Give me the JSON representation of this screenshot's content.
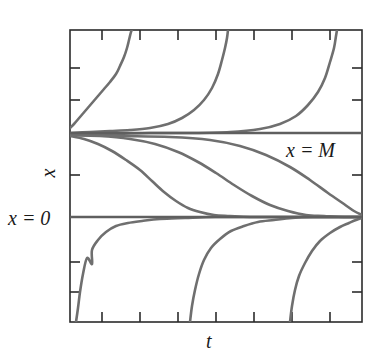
{
  "figure": {
    "kind": "solution-curves-plot",
    "background_color": "#ffffff",
    "frame_color": "#2b2b2b",
    "curve_color": "#6f6f6f",
    "equilibrium_color": "#5f5f5f",
    "text_color": "#1a1a1a"
  },
  "labels": {
    "x_axis": "x",
    "t_axis": "t",
    "equilibrium_upper": "x = M",
    "equilibrium_lower": "x = 0"
  },
  "chart_data": {
    "type": "line",
    "title": "",
    "xlabel": "t",
    "ylabel": "x",
    "grid": false,
    "legend": "none",
    "axis_tick_labels": {
      "x": [],
      "y": []
    },
    "xlim": [
      0,
      100
    ],
    "ylim": [
      -2,
      2.6
    ],
    "annotations": [
      {
        "text": "x = M",
        "x": 76,
        "y": 1.12
      },
      {
        "text": "x = 0",
        "x": -9,
        "y": 0.0
      }
    ],
    "equilibria": [
      {
        "name": "x = M",
        "value": 1.0,
        "stability": "stable",
        "pixel_y": 133
      },
      {
        "name": "x = 0",
        "value": 0.0,
        "stability": "unstable",
        "pixel_y": 217
      }
    ],
    "plot_box_pixels": {
      "left": 70,
      "top": 30,
      "right": 362,
      "bottom": 322
    },
    "ticks": {
      "top_pixel_x": [
        102,
        140,
        178,
        216,
        254,
        292,
        330
      ],
      "bottom_pixel_x": [
        102,
        140,
        178,
        216,
        254,
        292,
        330
      ],
      "left_pixel_y": [
        68,
        100,
        133,
        175,
        217,
        262,
        292
      ],
      "right_pixel_y": [
        68,
        100,
        133,
        175,
        217,
        262,
        292
      ],
      "tick_length": 10
    },
    "series": [
      {
        "name": "above-M-branch-1",
        "region": "x > M",
        "comment": "decays from blow-up asymptote down toward x = M",
        "asymptote_t": 70,
        "points_pixel": [
          [
            70,
            128
          ],
          [
            74,
            124
          ],
          [
            80,
            117
          ],
          [
            86,
            110
          ],
          [
            92,
            103
          ],
          [
            98,
            96
          ],
          [
            104,
            89
          ],
          [
            110,
            82
          ],
          [
            116,
            74
          ],
          [
            120,
            66
          ],
          [
            124,
            57
          ],
          [
            127,
            48
          ],
          [
            129,
            40
          ],
          [
            131,
            32
          ],
          [
            132,
            30
          ]
        ]
      },
      {
        "name": "above-M-branch-2",
        "region": "x > M",
        "comment": "decays from blow-up asymptote down toward x = M",
        "asymptote_t": 170,
        "points_pixel": [
          [
            70,
            133
          ],
          [
            90,
            132
          ],
          [
            110,
            131
          ],
          [
            130,
            130
          ],
          [
            150,
            128
          ],
          [
            168,
            124
          ],
          [
            182,
            118
          ],
          [
            194,
            110
          ],
          [
            204,
            100
          ],
          [
            212,
            88
          ],
          [
            218,
            74
          ],
          [
            222,
            60
          ],
          [
            225,
            48
          ],
          [
            227,
            38
          ],
          [
            228,
            30
          ]
        ]
      },
      {
        "name": "above-M-branch-3",
        "region": "x > M",
        "comment": "decays from blow-up asymptote down toward x = M",
        "asymptote_t": 300,
        "points_pixel": [
          [
            70,
            134
          ],
          [
            110,
            134
          ],
          [
            150,
            133
          ],
          [
            190,
            133
          ],
          [
            230,
            132
          ],
          [
            260,
            129
          ],
          [
            280,
            124
          ],
          [
            296,
            116
          ],
          [
            308,
            105
          ],
          [
            318,
            92
          ],
          [
            325,
            78
          ],
          [
            330,
            62
          ],
          [
            334,
            48
          ],
          [
            336,
            36
          ],
          [
            337,
            30
          ]
        ]
      },
      {
        "name": "between-0-and-M-branch-1",
        "region": "0 < x < M",
        "comment": "sigmoid falling from near M to near 0",
        "points_pixel": [
          [
            70,
            136
          ],
          [
            84,
            139
          ],
          [
            98,
            144
          ],
          [
            112,
            151
          ],
          [
            126,
            160
          ],
          [
            140,
            170
          ],
          [
            152,
            181
          ],
          [
            164,
            192
          ],
          [
            176,
            201
          ],
          [
            188,
            208
          ],
          [
            200,
            212
          ],
          [
            214,
            215
          ],
          [
            230,
            216
          ],
          [
            250,
            217
          ],
          [
            280,
            217
          ],
          [
            320,
            217
          ],
          [
            362,
            217
          ]
        ]
      },
      {
        "name": "between-0-and-M-branch-2",
        "region": "0 < x < M",
        "comment": "sigmoid falling from near M to near 0, shifted right",
        "points_pixel": [
          [
            70,
            135
          ],
          [
            100,
            136
          ],
          [
            130,
            139
          ],
          [
            155,
            144
          ],
          [
            178,
            152
          ],
          [
            198,
            162
          ],
          [
            216,
            173
          ],
          [
            234,
            185
          ],
          [
            252,
            196
          ],
          [
            270,
            205
          ],
          [
            288,
            211
          ],
          [
            306,
            215
          ],
          [
            324,
            216
          ],
          [
            344,
            217
          ],
          [
            362,
            217
          ]
        ]
      },
      {
        "name": "between-0-and-M-branch-3",
        "region": "0 < x < M",
        "comment": "slow sigmoid, reaches 0 only near the right edge",
        "points_pixel": [
          [
            70,
            135
          ],
          [
            120,
            136
          ],
          [
            170,
            137
          ],
          [
            210,
            140
          ],
          [
            240,
            146
          ],
          [
            266,
            155
          ],
          [
            290,
            167
          ],
          [
            310,
            180
          ],
          [
            328,
            193
          ],
          [
            344,
            204
          ],
          [
            354,
            211
          ],
          [
            362,
            215
          ]
        ]
      },
      {
        "name": "below-0-branch-1",
        "region": "x < 0",
        "comment": "rises from downward blow-up asymptote toward x = 0",
        "asymptote_t": 78,
        "points_pixel": [
          [
            76,
            322
          ],
          [
            78,
            308
          ],
          [
            80,
            292
          ],
          [
            83,
            274
          ],
          [
            87,
            258
          ],
          [
            92,
            264
          ],
          [
            92,
            250
          ],
          [
            98,
            240
          ],
          [
            106,
            232
          ],
          [
            116,
            226
          ],
          [
            128,
            223
          ],
          [
            142,
            221
          ],
          [
            160,
            219
          ],
          [
            185,
            218
          ],
          [
            215,
            217
          ],
          [
            260,
            217
          ],
          [
            320,
            217
          ],
          [
            362,
            217
          ]
        ]
      },
      {
        "name": "below-0-branch-2",
        "region": "x < 0",
        "comment": "rises from downward blow-up asymptote toward x = 0",
        "asymptote_t": 192,
        "points_pixel": [
          [
            190,
            322
          ],
          [
            192,
            306
          ],
          [
            195,
            290
          ],
          [
            199,
            274
          ],
          [
            204,
            260
          ],
          [
            211,
            248
          ],
          [
            220,
            239
          ],
          [
            231,
            231
          ],
          [
            244,
            226
          ],
          [
            258,
            222
          ],
          [
            274,
            220
          ],
          [
            292,
            218
          ],
          [
            312,
            217
          ],
          [
            336,
            217
          ],
          [
            362,
            217
          ]
        ]
      },
      {
        "name": "below-0-branch-3",
        "region": "x < 0",
        "comment": "rises from downward blow-up asymptote toward x = 0",
        "asymptote_t": 292,
        "points_pixel": [
          [
            290,
            322
          ],
          [
            292,
            306
          ],
          [
            295,
            290
          ],
          [
            299,
            276
          ],
          [
            305,
            263
          ],
          [
            312,
            251
          ],
          [
            320,
            241
          ],
          [
            330,
            233
          ],
          [
            340,
            227
          ],
          [
            349,
            223
          ],
          [
            356,
            220
          ],
          [
            362,
            218
          ]
        ]
      }
    ]
  }
}
